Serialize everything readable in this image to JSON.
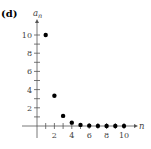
{
  "chart_data": {
    "type": "scatter",
    "panel_label": "(d)",
    "title": "",
    "xlabel": "n",
    "ylabel": "a",
    "ylabel_subscript": "n",
    "xlim": [
      0,
      11
    ],
    "ylim": [
      0,
      11
    ],
    "x_ticks": [
      1,
      2,
      3,
      4,
      5,
      6,
      7,
      8,
      9,
      10
    ],
    "x_tick_labels": [
      "2",
      "4",
      "6",
      "8",
      "10"
    ],
    "x_tick_label_values": [
      2,
      4,
      6,
      8,
      10
    ],
    "y_ticks": [
      1,
      2,
      3,
      4,
      5,
      6,
      7,
      8,
      9,
      10
    ],
    "y_tick_labels": [
      "2",
      "4",
      "6",
      "8",
      "10"
    ],
    "y_tick_label_values": [
      2,
      4,
      6,
      8,
      10
    ],
    "grid": false,
    "legend": "none",
    "series": [
      {
        "name": "a_n",
        "x": [
          1,
          2,
          3,
          4,
          5,
          6,
          7,
          8,
          9,
          10
        ],
        "y": [
          10,
          3.33,
          1.11,
          0.37,
          0.12,
          0.04,
          0.01,
          0.005,
          0.002,
          0.001
        ]
      }
    ]
  }
}
